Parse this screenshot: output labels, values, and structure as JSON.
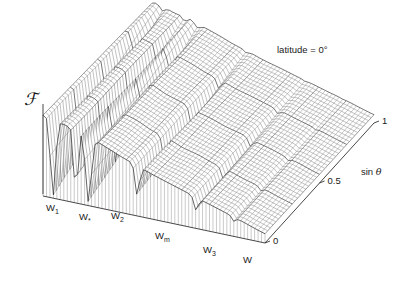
{
  "figure": {
    "annotation": "latitude = 0°",
    "vertical_axis_label": "ℱ",
    "depth_axis_label_prefix": "sin ",
    "depth_axis_label_symbol": "θ",
    "horizontal_axis_label": "W",
    "background_color": "#ffffff",
    "mesh_color": "#4a4a4a",
    "axis_color": "#333333"
  },
  "depth_axis": {
    "name": "sin theta",
    "ticks": [
      {
        "value": 0,
        "label": "0"
      },
      {
        "value": 0.5,
        "label": "0.5"
      },
      {
        "value": 1,
        "label": "1"
      }
    ],
    "range": [
      0,
      1
    ]
  },
  "feature_labels": [
    {
      "id": "w1",
      "label": "W",
      "sub": "1",
      "x": 46,
      "y": 203
    },
    {
      "id": "wstar",
      "label": "W",
      "sub": "*",
      "x": 79,
      "y": 212
    },
    {
      "id": "w2",
      "label": "W",
      "sub": "2",
      "x": 111,
      "y": 211
    },
    {
      "id": "wm",
      "label": "W",
      "sub": "m",
      "x": 155,
      "y": 231
    },
    {
      "id": "w3",
      "label": "W",
      "sub": "3",
      "x": 203,
      "y": 245
    },
    {
      "id": "w",
      "label": "W",
      "sub": "",
      "x": 243,
      "y": 255
    }
  ],
  "chart_data": {
    "type": "surface",
    "title": "",
    "subtitle": "",
    "annotation": "latitude = 0°",
    "xlabel": "W",
    "ylabel": "sin θ",
    "zlabel": "ℱ",
    "xlim": [
      0,
      1
    ],
    "ylim": [
      0,
      1
    ],
    "zlim": [
      0,
      1
    ],
    "grid": false,
    "projection": {
      "origin_px": [
        43,
        196
      ],
      "x_vec_px": [
        222,
        47
      ],
      "y_vec_px": [
        109,
        -120
      ],
      "z_vec_px": [
        0,
        -92
      ],
      "nx": 64,
      "ny": 40
    },
    "notches": [
      {
        "name": "W1",
        "x": 0.045,
        "width": 0.016,
        "depth": 0.97
      },
      {
        "name": "W*",
        "x": 0.148,
        "width": 0.012,
        "depth": 0.92
      },
      {
        "name": "W2",
        "x": 0.205,
        "width": 0.017,
        "depth": 0.95
      },
      {
        "name": "Wm",
        "x": 0.425,
        "width": 0.013,
        "depth": 0.6
      },
      {
        "name": "W3",
        "x": 0.69,
        "width": 0.013,
        "depth": 0.42
      },
      {
        "name": "W",
        "x": 0.86,
        "width": 0.011,
        "depth": 0.22
      }
    ],
    "baseline_profile": {
      "x": [
        0.0,
        0.03,
        0.06,
        0.1,
        0.14,
        0.18,
        0.22,
        0.26,
        0.3,
        0.36,
        0.42,
        0.5,
        0.58,
        0.66,
        0.74,
        0.82,
        0.9,
        0.96,
        1.0
      ],
      "z": [
        0.88,
        0.9,
        0.86,
        0.82,
        0.8,
        0.78,
        0.74,
        0.7,
        0.66,
        0.6,
        0.55,
        0.48,
        0.42,
        0.36,
        0.3,
        0.24,
        0.18,
        0.13,
        0.1
      ]
    },
    "depth_falloff": {
      "y": [
        0.0,
        0.25,
        0.5,
        0.75,
        1.0
      ],
      "notch_strength": [
        1.0,
        0.85,
        0.62,
        0.34,
        0.08
      ]
    }
  }
}
